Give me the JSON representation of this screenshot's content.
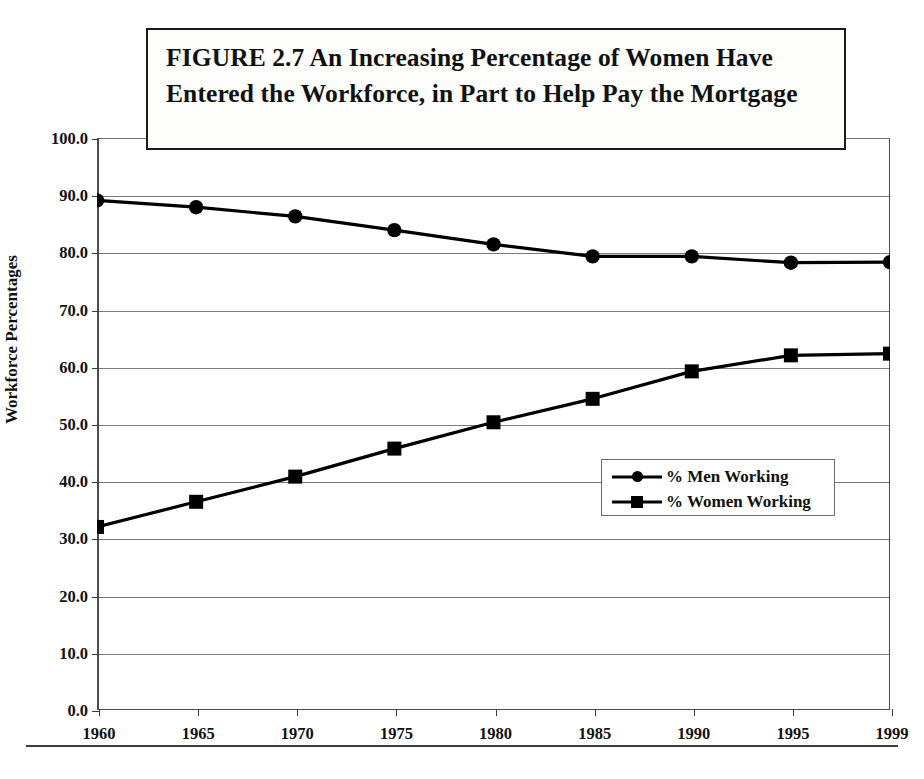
{
  "figure": {
    "title": "FIGURE 2.7  An Increasing Percentage of Women Have Entered the Workforce, in Part to Help Pay the Mortgage"
  },
  "chart_data": {
    "type": "line",
    "title": "FIGURE 2.7  An Increasing Percentage of Women Have Entered the Workforce, in Part to Help Pay the Mortgage",
    "xlabel": "",
    "ylabel": "Workforce Percentages",
    "x": [
      1960,
      1965,
      1970,
      1975,
      1980,
      1985,
      1990,
      1995,
      1999
    ],
    "x_tick_labels": [
      "1960",
      "1965",
      "1970",
      "1975",
      "1980",
      "1985",
      "1990",
      "1995",
      "1999"
    ],
    "y_tick_labels": [
      "0.0",
      "10.0",
      "20.0",
      "30.0",
      "40.0",
      "50.0",
      "60.0",
      "70.0",
      "80.0",
      "90.0",
      "100.0"
    ],
    "y_ticks": [
      0,
      10,
      20,
      30,
      40,
      50,
      60,
      70,
      80,
      90,
      100
    ],
    "ylim": [
      0,
      100
    ],
    "grid": "horizontal",
    "legend_position": "center-right-inside",
    "series": [
      {
        "name": "% Men Working",
        "marker": "circle",
        "color": "#000000",
        "values": [
          89.1,
          87.9,
          86.3,
          83.9,
          81.4,
          79.3,
          79.3,
          78.2,
          78.3
        ]
      },
      {
        "name": "% Women Working",
        "marker": "square",
        "color": "#000000",
        "values": [
          32.0,
          36.4,
          40.8,
          45.7,
          50.3,
          54.4,
          59.2,
          62.0,
          62.3
        ]
      }
    ]
  },
  "legend": {
    "items": [
      {
        "label": "% Men Working"
      },
      {
        "label": "% Women Working"
      }
    ]
  },
  "colors": {
    "ink": "#000000",
    "grid": "#7b7b7b",
    "axis": "#3a3a3a",
    "background": "#ffffff"
  }
}
